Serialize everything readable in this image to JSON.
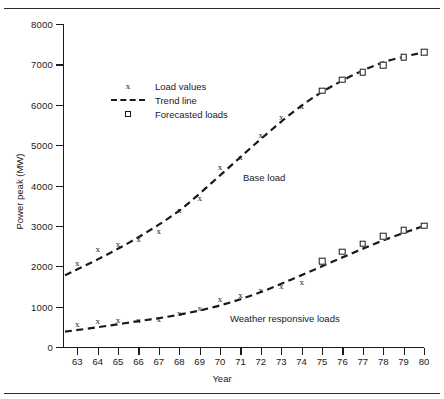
{
  "chart_data": {
    "type": "line",
    "title": "",
    "xlabel": "Year",
    "ylabel": "Power peak (MW)",
    "xlim": [
      62.3,
      80
    ],
    "ylim": [
      0,
      8000
    ],
    "grid": false,
    "x_ticks": [
      "63",
      "64",
      "65",
      "66",
      "67",
      "68",
      "69",
      "70",
      "71",
      "72",
      "73",
      "74",
      "75",
      "76",
      "77",
      "78",
      "79",
      "80"
    ],
    "y_ticks": [
      "0",
      "1000",
      "2000",
      "3000",
      "4000",
      "5000",
      "6000",
      "7000",
      "8000"
    ],
    "legend": {
      "position": "upper-left-inside",
      "entries": [
        {
          "label": "Load values",
          "marker": "x-marker"
        },
        {
          "label": "Trend line",
          "marker": "dashed-line"
        },
        {
          "label": "Forecasted loads",
          "marker": "square-marker"
        }
      ]
    },
    "annotations": [
      {
        "text": "Base load",
        "x": 71.3,
        "y": 4350
      },
      {
        "text": "Weather responsive loads",
        "x": 70.7,
        "y": 900
      }
    ],
    "series": [
      {
        "name": "Base load",
        "annotation": "Base load",
        "trend_x": [
          62.4,
          64,
          66,
          68,
          70,
          72,
          74,
          76,
          78,
          80
        ],
        "trend_y": [
          1780,
          2170,
          2720,
          3380,
          4250,
          5150,
          5980,
          6600,
          7050,
          7300
        ],
        "observed": {
          "marker": "x-marker",
          "x": [
            63,
            64,
            65,
            66,
            67,
            68,
            69,
            70,
            71,
            72,
            73,
            74
          ],
          "y": [
            2080,
            2420,
            2560,
            2680,
            2880,
            3400,
            3700,
            4450,
            4700,
            5250,
            5700,
            5980
          ]
        },
        "forecast": {
          "marker": "square-marker",
          "x": [
            75,
            76,
            77,
            78,
            79,
            80
          ],
          "y": [
            6350,
            6620,
            6800,
            6980,
            7180,
            7300
          ]
        }
      },
      {
        "name": "Weather responsive loads",
        "annotation": "Weather responsive loads",
        "trend_x": [
          62.4,
          64,
          66,
          68,
          70,
          72,
          74,
          76,
          78,
          80
        ],
        "trend_y": [
          380,
          490,
          640,
          800,
          1030,
          1360,
          1780,
          2220,
          2640,
          3000
        ],
        "observed": {
          "marker": "x-marker",
          "x": [
            63,
            64,
            65,
            66,
            67,
            68,
            69,
            70,
            71,
            72,
            73,
            74
          ],
          "y": [
            560,
            640,
            660,
            670,
            700,
            840,
            960,
            1180,
            1280,
            1400,
            1520,
            1620
          ]
        },
        "forecast": {
          "marker": "square-marker",
          "x": [
            75,
            76,
            77,
            78,
            79,
            80
          ],
          "y": [
            2120,
            2360,
            2560,
            2740,
            2900,
            3000
          ]
        }
      }
    ]
  }
}
